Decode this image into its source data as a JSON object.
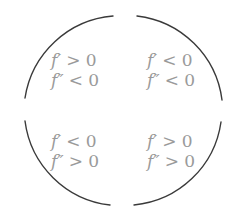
{
  "diagram": {
    "title": "",
    "stroke_color": "#3a3a3a",
    "text_color": "#9a9a9a",
    "circle": {
      "center": [
        123.5,
        110.5
      ],
      "radius": 97,
      "arcs": [
        {
          "name": "top-left",
          "from": [
            25,
            98
          ],
          "to": [
            113,
            16
          ]
        },
        {
          "name": "top-right",
          "from": [
            137,
            16
          ],
          "to": [
            222,
            100
          ]
        },
        {
          "name": "bottom-left",
          "from": [
            25,
            121
          ],
          "to": [
            110,
            205
          ]
        },
        {
          "name": "bottom-right",
          "from": [
            134,
            205
          ],
          "to": [
            221,
            122
          ]
        }
      ]
    },
    "quadrants": {
      "top_left": {
        "line1": {
          "fn": "f′",
          "rel": "> 0"
        },
        "line2": {
          "fn": "f″",
          "rel": "< 0"
        }
      },
      "top_right": {
        "line1": {
          "fn": "f′",
          "rel": "< 0"
        },
        "line2": {
          "fn": "f″",
          "rel": "< 0"
        }
      },
      "bottom_left": {
        "line1": {
          "fn": "f′",
          "rel": "< 0"
        },
        "line2": {
          "fn": "f″",
          "rel": "> 0"
        }
      },
      "bottom_right": {
        "line1": {
          "fn": "f′",
          "rel": "> 0"
        },
        "line2": {
          "fn": "f″",
          "rel": "> 0"
        }
      }
    }
  }
}
